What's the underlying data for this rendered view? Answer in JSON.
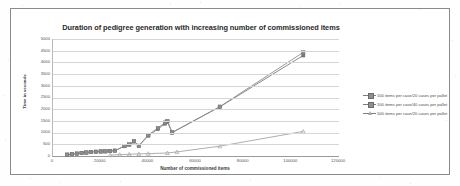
{
  "chart_data": {
    "type": "line",
    "title": "Duration of pedigree generation with increasing number of commissioned items",
    "xlabel": "Number of commissioned items",
    "ylabel": "Time in seconds",
    "xlim": [
      0,
      120000
    ],
    "ylim": [
      0,
      5000
    ],
    "xticks": [
      0,
      20000,
      40000,
      60000,
      80000,
      100000,
      120000
    ],
    "xtick_labels": [
      "0",
      "20000",
      "40000",
      "60000",
      "80000",
      "100000",
      "120000"
    ],
    "yticks": [
      0,
      500,
      1000,
      1500,
      2000,
      2500,
      3000,
      3500,
      4000,
      4500,
      5000
    ],
    "ytick_labels": [
      "0",
      "500",
      "1000",
      "1500",
      "2000",
      "2500",
      "3000",
      "3500",
      "4000",
      "4500",
      "5000"
    ],
    "grid": true,
    "grid_axis": "y",
    "legend_position": "right",
    "series": [
      {
        "name": "100 items per case/20 cases per pallet",
        "marker": "square",
        "color": "#7a7a7a",
        "points": [
          [
            6000,
            60
          ],
          [
            8000,
            80
          ],
          [
            10000,
            105
          ],
          [
            12000,
            130
          ],
          [
            14000,
            150
          ],
          [
            16000,
            175
          ],
          [
            18000,
            185
          ],
          [
            20000,
            195
          ],
          [
            22000,
            200
          ],
          [
            24000,
            215
          ],
          [
            26000,
            230
          ],
          [
            30000,
            420
          ],
          [
            32000,
            480
          ],
          [
            34000,
            620
          ],
          [
            36000,
            430
          ],
          [
            40000,
            870
          ],
          [
            44000,
            1150
          ],
          [
            47000,
            1380
          ],
          [
            48000,
            1450
          ],
          [
            50000,
            1000
          ],
          [
            70000,
            2100
          ],
          [
            105000,
            4300
          ]
        ]
      },
      {
        "name": "100 items per case/40 cases per pallet",
        "marker": "square",
        "color": "#8d8d8d",
        "points": [
          [
            6000,
            55
          ],
          [
            8000,
            75
          ],
          [
            10000,
            100
          ],
          [
            12000,
            125
          ],
          [
            14000,
            145
          ],
          [
            16000,
            170
          ],
          [
            18000,
            180
          ],
          [
            20000,
            190
          ],
          [
            22000,
            198
          ],
          [
            24000,
            210
          ],
          [
            26000,
            225
          ],
          [
            30000,
            430
          ],
          [
            32000,
            500
          ],
          [
            34000,
            640
          ],
          [
            36000,
            440
          ],
          [
            40000,
            900
          ],
          [
            44000,
            1200
          ],
          [
            47000,
            1430
          ],
          [
            48000,
            1500
          ],
          [
            50000,
            1010
          ],
          [
            70000,
            2110
          ],
          [
            105000,
            4430
          ]
        ]
      },
      {
        "name": "500 items per case/20 cases per pallet",
        "marker": "triangle",
        "color": "#a5a5a5",
        "points": [
          [
            24000,
            40
          ],
          [
            28000,
            55
          ],
          [
            32000,
            75
          ],
          [
            36000,
            90
          ],
          [
            40000,
            100
          ],
          [
            48000,
            130
          ],
          [
            52000,
            175
          ],
          [
            70000,
            420
          ],
          [
            105000,
            1050
          ]
        ]
      }
    ]
  },
  "legend": {
    "items": [
      {
        "label": "100 items per case/20 cases per pallet",
        "marker": "square"
      },
      {
        "label": "100 items per case/40 cases per pallet",
        "marker": "square"
      },
      {
        "label": "500 items per case/20 cases per pallet",
        "marker": "triangle"
      }
    ]
  }
}
